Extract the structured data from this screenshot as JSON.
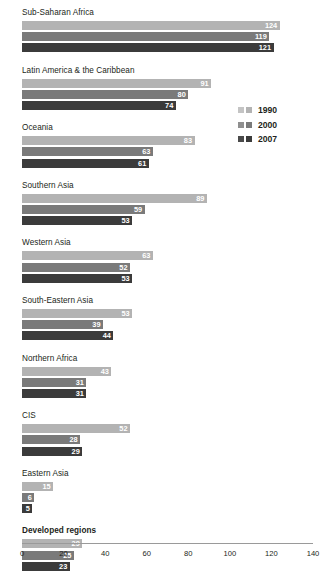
{
  "chart_data": {
    "type": "bar",
    "orientation": "horizontal",
    "title": "",
    "xlabel": "",
    "ylabel": "",
    "xlim": [
      0,
      140
    ],
    "xticks": [
      0,
      20,
      40,
      60,
      80,
      100,
      120,
      140
    ],
    "grid": false,
    "legend_position": "upper-right",
    "categories": [
      "Sub-Saharan Africa",
      "Latin America & the Caribbean",
      "Oceania",
      "Southern Asia",
      "Western Asia",
      "South-Eastern Asia",
      "Northern Africa",
      "CIS",
      "Eastern Asia",
      "Developed regions",
      "Developing regions"
    ],
    "series": [
      {
        "name": "1990",
        "color": "#b3b3b3",
        "values": [
          124,
          91,
          83,
          89,
          63,
          53,
          43,
          52,
          15,
          29,
          65
        ]
      },
      {
        "name": "2000",
        "color": "#7a7a7a",
        "values": [
          119,
          80,
          63,
          59,
          52,
          39,
          31,
          28,
          6,
          25,
          55
        ]
      },
      {
        "name": "2007",
        "color": "#3b3b3b",
        "values": [
          121,
          74,
          61,
          53,
          53,
          44,
          31,
          29,
          5,
          23,
          52
        ]
      }
    ]
  },
  "groups": [
    {
      "label": "Sub-Saharan Africa",
      "bold": false,
      "values": [
        124,
        119,
        121
      ]
    },
    {
      "label": "Latin America & the Caribbean",
      "bold": false,
      "values": [
        91,
        80,
        74
      ]
    },
    {
      "label": "Oceania",
      "bold": false,
      "values": [
        83,
        63,
        61
      ]
    },
    {
      "label": "Southern Asia",
      "bold": false,
      "values": [
        89,
        59,
        53
      ]
    },
    {
      "label": "Western Asia",
      "bold": false,
      "values": [
        63,
        52,
        53
      ]
    },
    {
      "label": "South-Eastern Asia",
      "bold": false,
      "values": [
        53,
        39,
        44
      ]
    },
    {
      "label": "Northern Africa",
      "bold": false,
      "values": [
        43,
        31,
        31
      ]
    },
    {
      "label": "CIS",
      "bold": false,
      "values": [
        52,
        28,
        29
      ]
    },
    {
      "label": "Eastern Asia",
      "bold": false,
      "values": [
        15,
        6,
        5
      ]
    },
    {
      "label": "Developed regions",
      "bold": true,
      "values": [
        29,
        25,
        23
      ]
    },
    {
      "label": "Developing regions",
      "bold": true,
      "values": [
        65,
        55,
        52
      ]
    }
  ],
  "legend": {
    "items": [
      {
        "label": "1990"
      },
      {
        "label": "2000"
      },
      {
        "label": "2007"
      }
    ]
  },
  "axis": {
    "ticks": [
      "0",
      "20",
      "40",
      "60",
      "80",
      "100",
      "120",
      "140"
    ]
  }
}
